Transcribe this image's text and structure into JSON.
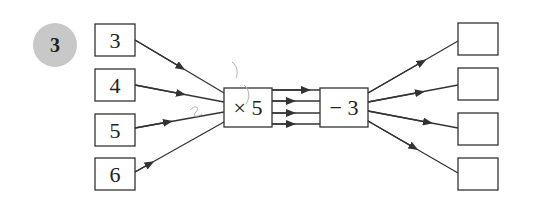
{
  "problem": {
    "number": "3",
    "badge_color": "#c8c8c8"
  },
  "inputs": [
    "3",
    "4",
    "5",
    "6"
  ],
  "operations": [
    {
      "label": "× 5"
    },
    {
      "label": "− 3"
    }
  ],
  "outputs": [
    "",
    "",
    "",
    ""
  ],
  "colors": {
    "stroke": "#333333",
    "text": "#222222"
  }
}
